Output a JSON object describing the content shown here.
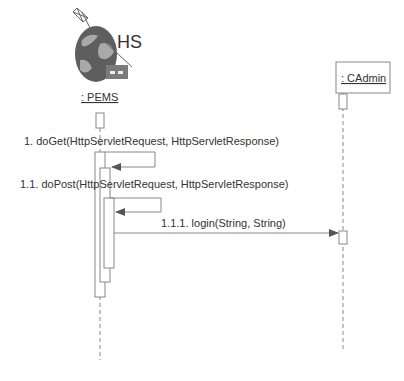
{
  "diagram": {
    "type": "sequence",
    "lifelines": [
      {
        "id": "pems",
        "label": ": PEMS",
        "badge": "HS",
        "icon": "globe-server-icon"
      },
      {
        "id": "cadmin",
        "label": ": CAdmin"
      }
    ],
    "messages": [
      {
        "number": "1.",
        "text": "1. doGet(HttpServletRequest, HttpServletResponse)",
        "from": "pems",
        "to": "pems",
        "kind": "self"
      },
      {
        "number": "1.1.",
        "text": "1.1. doPost(HttpServletRequest, HttpServletResponse)",
        "from": "pems",
        "to": "pems",
        "kind": "self"
      },
      {
        "number": "1.1.1.",
        "text": "1.1.1. login(String, String)",
        "from": "pems",
        "to": "cadmin",
        "kind": "call"
      }
    ],
    "colors": {
      "line": "#888888",
      "text": "#333333",
      "globe_dark": "#5a5a5a",
      "globe_light": "#a8a8a8",
      "server": "#7a7a7a"
    }
  }
}
